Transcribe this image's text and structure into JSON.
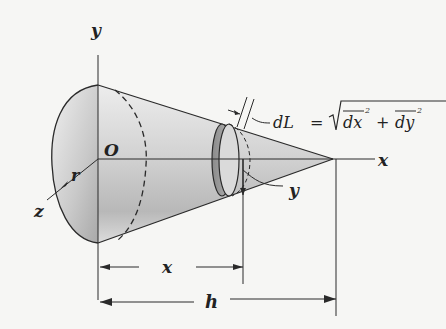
{
  "figure": {
    "type": "cone-surface-area-derivation",
    "labels": {
      "y_axis": "y",
      "x_axis": "x",
      "z_axis": "z",
      "origin": "O",
      "radius": "r",
      "disk_radius": "y",
      "distance_x": "x",
      "height": "h"
    },
    "equation": {
      "lhs": "dL",
      "equals": "=",
      "rhs_term1": "dx",
      "plus": "+",
      "rhs_term2": "dy",
      "exponent": "2"
    },
    "colors": {
      "background": "#f6f6f4",
      "line": "#2a2a2a",
      "shade_dark": "#9a9a9a",
      "shade_light": "#e6e6e6"
    }
  }
}
